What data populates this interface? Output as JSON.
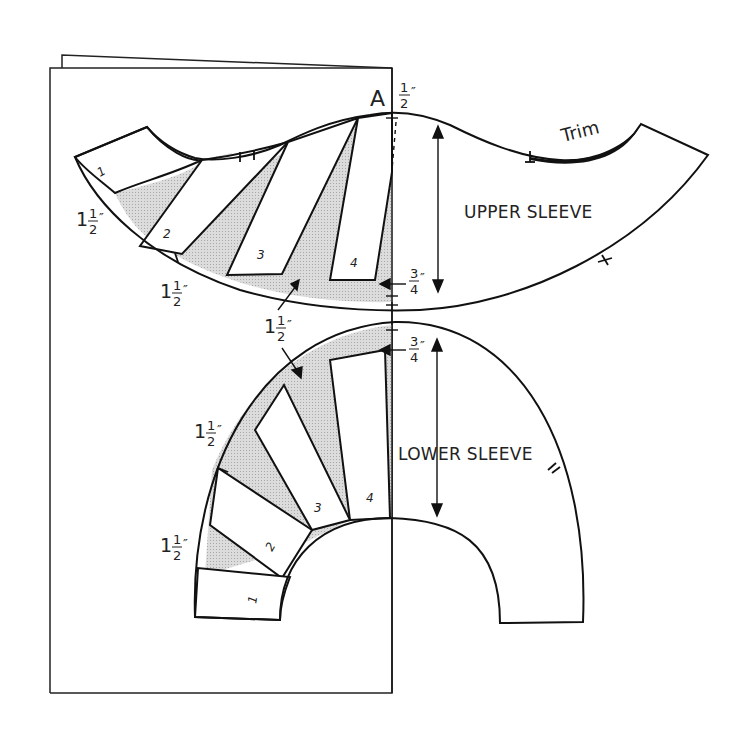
{
  "diagram": {
    "type": "sewing-pattern-alteration",
    "point_label": "A",
    "top_measure": {
      "whole": "",
      "num": "1",
      "den": "2",
      "unit": "″"
    },
    "upper_sleeve": {
      "title": "UPPER SLEEVE",
      "trim_label": "Trim",
      "sections": [
        "1",
        "2",
        "3",
        "4"
      ],
      "measures": [
        {
          "whole": "1",
          "num": "1",
          "den": "2",
          "unit": "″"
        },
        {
          "whole": "1",
          "num": "1",
          "den": "2",
          "unit": "″"
        }
      ],
      "seam_allowance": {
        "whole": "",
        "num": "3",
        "den": "4",
        "unit": "″"
      }
    },
    "middle_measure": {
      "whole": "1",
      "num": "1",
      "den": "2",
      "unit": "″"
    },
    "lower_sleeve": {
      "title": "LOWER SLEEVE",
      "sections": [
        "1",
        "2",
        "3",
        "4"
      ],
      "measures": [
        {
          "whole": "1",
          "num": "1",
          "den": "2",
          "unit": "″"
        },
        {
          "whole": "1",
          "num": "1",
          "den": "2",
          "unit": "″"
        }
      ],
      "seam_allowance": {
        "whole": "",
        "num": "3",
        "den": "4",
        "unit": "″"
      }
    },
    "colors": {
      "line": "#111111",
      "shade": "#d4d4d4",
      "paper": "#ffffff"
    }
  }
}
